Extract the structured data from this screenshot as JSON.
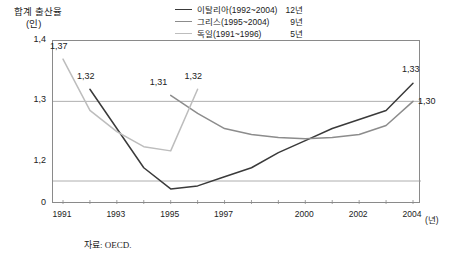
{
  "chart_data": {
    "type": "line",
    "title": "",
    "ylabel": "합계 출산율",
    "yunit": "(인)",
    "xlabel": "",
    "xunit": "(년)",
    "x": [
      1991,
      1992,
      1993,
      1994,
      1995,
      1996,
      1997,
      1998,
      1999,
      2000,
      2001,
      2002,
      2003,
      2004
    ],
    "xtick_labels": [
      "1991",
      "1993",
      "1995",
      "1997",
      "2000",
      "2002",
      "2004"
    ],
    "xtick_values": [
      1991,
      1993,
      1995,
      1997,
      2000,
      2002,
      2004
    ],
    "ytick_labels": [
      "1,4",
      "1,3",
      "1,2",
      "0"
    ],
    "ytick_values": [
      1.4,
      1.3,
      1.2,
      0
    ],
    "ylim": [
      1.13,
      1.4
    ],
    "grid": "horizontal",
    "axis_break": true,
    "legend_position": "top-right",
    "series": [
      {
        "name": "이탈리아(1992~2004)",
        "duration": "12년",
        "color": "#3a3a3a",
        "x": [
          1992,
          1993,
          1994,
          1995,
          1996,
          1997,
          1998,
          1999,
          2000,
          2001,
          2002,
          2003,
          2004
        ],
        "values": [
          1.32,
          1.255,
          1.19,
          1.155,
          1.16,
          1.175,
          1.19,
          1.215,
          1.235,
          1.255,
          1.27,
          1.285,
          1.33
        ],
        "point_labels": [
          {
            "x": 1992,
            "value": 1.32,
            "text": "1,32"
          },
          {
            "x": 2004,
            "value": 1.33,
            "text": "1,33"
          }
        ]
      },
      {
        "name": "그리스(1995~2004)",
        "duration": "9년",
        "color": "#8c8c8c",
        "x": [
          1995,
          1996,
          1997,
          1998,
          1999,
          2000,
          2001,
          2002,
          2003,
          2004
        ],
        "values": [
          1.31,
          1.28,
          1.255,
          1.245,
          1.24,
          1.238,
          1.24,
          1.245,
          1.26,
          1.3
        ],
        "point_labels": [
          {
            "x": 1995,
            "value": 1.31,
            "text": "1,31"
          },
          {
            "x": 2004,
            "value": 1.3,
            "text": "1,30"
          }
        ]
      },
      {
        "name": "독일(1991~1996)",
        "duration": "5년",
        "color": "#bdbdbd",
        "x": [
          1991,
          1992,
          1993,
          1994,
          1995,
          1996
        ],
        "values": [
          1.37,
          1.285,
          1.25,
          1.225,
          1.218,
          1.32
        ],
        "point_labels": [
          {
            "x": 1991,
            "value": 1.37,
            "text": "1,37"
          },
          {
            "x": 1996,
            "value": 1.32,
            "text": "1,32"
          }
        ]
      }
    ]
  },
  "footer": {
    "source": "자료: OECD."
  }
}
